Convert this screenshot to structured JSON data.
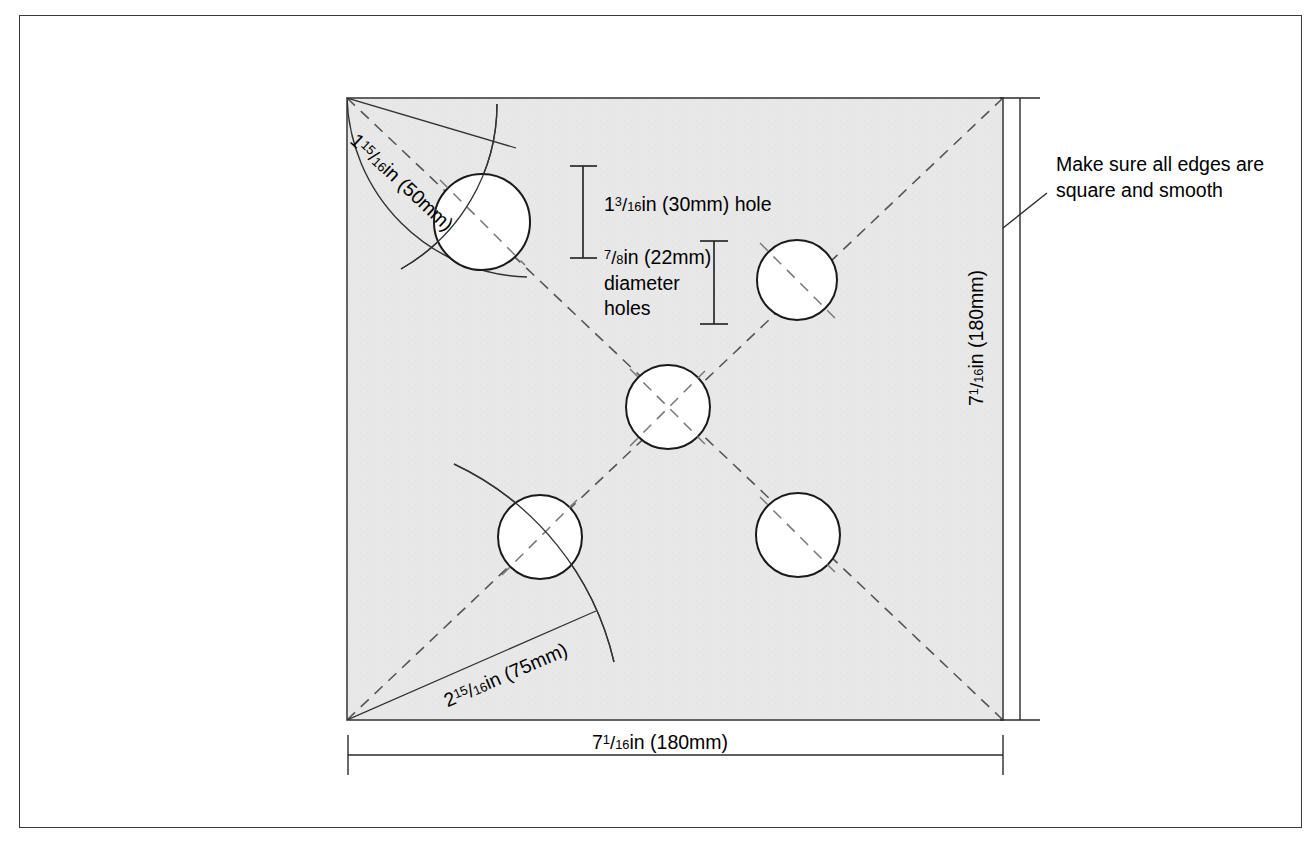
{
  "page": {
    "background_color": "#ffffff",
    "frame_color": "#3a3a3a",
    "plate_fill_color": "#e6e6e6",
    "plate_stroke_color": "#4a4a4a",
    "line_color": "#1a1a1a",
    "width": 1315,
    "height": 847
  },
  "drawing": {
    "title": "Square plate with five drilled holes",
    "plate": {
      "shape": "square",
      "width_label": "7 1/16 in (180mm)",
      "height_label": "7 1/16 in (180mm)"
    },
    "holes": [
      {
        "name": "hole-top-left",
        "cx": 482,
        "cy": 222,
        "r": 48
      },
      {
        "name": "hole-top-right",
        "cx": 797,
        "cy": 280,
        "r": 40
      },
      {
        "name": "hole-center",
        "cx": 668,
        "cy": 407,
        "r": 42
      },
      {
        "name": "hole-bottom-left",
        "cx": 540,
        "cy": 537,
        "r": 42
      },
      {
        "name": "hole-bottom-right",
        "cx": 798,
        "cy": 535,
        "r": 42
      }
    ]
  },
  "labels": {
    "hole_30": {
      "whole": "1",
      "num": "3",
      "den": "16",
      "suffix": "in (30mm) hole"
    },
    "hole_22": {
      "whole": "",
      "num": "7",
      "den": "8",
      "suffix": "in (22mm)",
      "line2": "diameter",
      "line3": "holes"
    },
    "dim_bottom": {
      "whole": "7",
      "num": "1",
      "den": "16",
      "suffix": "in (180mm)"
    },
    "dim_right": {
      "whole": "7",
      "num": "1",
      "den": "16",
      "suffix": "in (180mm)"
    },
    "radius_50": {
      "whole": "1",
      "num": "15",
      "den": "16",
      "suffix": "in (50mm)"
    },
    "radius_75": {
      "whole": "2",
      "num": "15",
      "den": "16",
      "suffix": "in (75mm)"
    },
    "note_edges": "Make sure all edges are square and smooth"
  }
}
